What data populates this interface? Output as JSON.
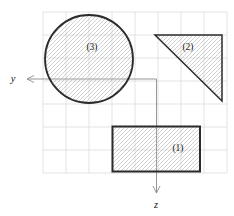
{
  "canvas": {
    "width": 234,
    "height": 216,
    "background": "#ffffff"
  },
  "grid": {
    "x_start": 43,
    "x_end": 227,
    "y_start": 12,
    "y_end": 173,
    "spacing": 23,
    "color": "#dcdcdc",
    "line_width": 0.8
  },
  "style": {
    "outline_color": "#2b2b2b",
    "hatch_color": "#bdbdbd",
    "hatch_spacing": 4,
    "axis_color": "#8a8a8a",
    "label_color": "#1a1a1a",
    "label_font_size": 9.5,
    "axis_font_size": 10.5
  },
  "axes": {
    "origin_x": 156.5,
    "origin_y": 79,
    "y_axis": {
      "label": "y",
      "tip_x": 27,
      "label_x": 13,
      "label_y": 82
    },
    "z_axis": {
      "label": "z",
      "tip_y": 193,
      "label_x": 156,
      "label_y": 208
    }
  },
  "shapes": [
    {
      "type": "circle",
      "label": "(3)",
      "cx": 89,
      "cy": 59,
      "r": 44,
      "stroke_width": 1.8,
      "label_x": 92,
      "label_y": 50
    },
    {
      "type": "triangle",
      "label": "(2)",
      "points": "155,35 222,35 222,101",
      "stroke_width": 1.5,
      "label_x": 188,
      "label_y": 50
    },
    {
      "type": "rect",
      "label": "(1)",
      "x": 112.5,
      "y": 126.5,
      "w": 87.5,
      "h": 45,
      "stroke_width": 2,
      "label_x": 178,
      "label_y": 151
    }
  ]
}
